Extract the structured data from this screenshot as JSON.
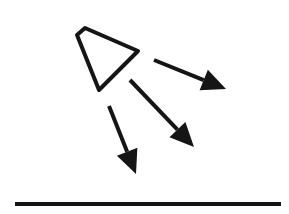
{
  "diagram": {
    "colors": {
      "stroke": "#151515",
      "background": "#ffffff"
    },
    "source": {
      "icon": "light-source-icon",
      "points": [
        [
          77,
          35
        ],
        [
          85,
          28
        ],
        [
          138,
          51
        ],
        [
          99,
          90
        ]
      ]
    },
    "rays": [
      {
        "id": "ray-right",
        "from": [
          154,
          60
        ],
        "to": [
          226,
          89
        ]
      },
      {
        "id": "ray-diagonal",
        "from": [
          130,
          80
        ],
        "to": [
          194,
          147
        ]
      },
      {
        "id": "ray-down",
        "from": [
          109,
          106
        ],
        "to": [
          136,
          174
        ]
      }
    ],
    "surface": {
      "from": [
        15,
        204
      ],
      "to": [
        281,
        204
      ]
    }
  }
}
